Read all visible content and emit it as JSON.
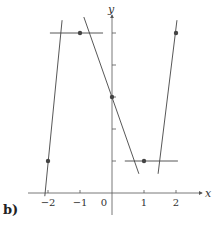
{
  "figure": {
    "part_label": "b)",
    "x_axis_label": "x",
    "y_axis_label": "y",
    "x_ticks": [
      {
        "value": -2,
        "label": "−2"
      },
      {
        "value": -1,
        "label": "−1"
      },
      {
        "value": 0,
        "label": "0"
      },
      {
        "value": 1,
        "label": "1"
      },
      {
        "value": 2,
        "label": "2"
      }
    ],
    "y_ticks": [
      1,
      2,
      3,
      4,
      5
    ],
    "points": [
      {
        "x": -2,
        "y": 1
      },
      {
        "x": -1,
        "y": 5
      },
      {
        "x": 0,
        "y": 3
      },
      {
        "x": 1,
        "y": 1
      },
      {
        "x": 2,
        "y": 5
      }
    ],
    "tangent_lines": [
      {
        "at_x": -2,
        "from": [
          -2.1,
          -0.1
        ],
        "to": [
          -1.56,
          5.4
        ]
      },
      {
        "at_x": -1,
        "from": [
          -1.94,
          5
        ],
        "to": [
          -0.28,
          5
        ]
      },
      {
        "at_x": 0,
        "from": [
          -0.88,
          5.5
        ],
        "to": [
          0.84,
          0.6
        ]
      },
      {
        "at_x": 1,
        "from": [
          0.4,
          1
        ],
        "to": [
          2.06,
          1
        ]
      },
      {
        "at_x": 2,
        "from": [
          1.44,
          0.6
        ],
        "to": [
          2.03,
          5.4
        ]
      }
    ],
    "colors": {
      "axis": "#555555",
      "line": "#444444",
      "point": "#444444"
    }
  }
}
